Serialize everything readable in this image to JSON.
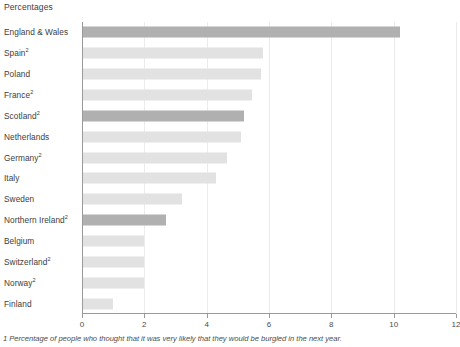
{
  "chart": {
    "title": "Percentages",
    "footnote": "1 Percentage of people who thought that it was very likely that they would be burgled in the next year.",
    "highlight_color": "#b0b0b0",
    "bar_color": "#e2e2e2",
    "axis_color": "#9a9a9a",
    "grid_color": "#ebebeb",
    "text_color": "#404040"
  },
  "chart_data": {
    "type": "bar",
    "orientation": "horizontal",
    "title": "Percentages",
    "xlabel": "",
    "ylabel": "",
    "xlim": [
      0,
      12
    ],
    "xticks": [
      0,
      2,
      4,
      6,
      8,
      10,
      12
    ],
    "xtick_labels": [
      "0",
      "2",
      "4",
      "6",
      "8",
      "10",
      "12"
    ],
    "grid": true,
    "legend": false,
    "categories": [
      "England & Wales",
      "Spain",
      "Poland",
      "France",
      "Scotland",
      "Netherlands",
      "Germany",
      "Italy",
      "Sweden",
      "Northern Ireland",
      "Belgium",
      "Switzerland",
      "Norway",
      "Finland"
    ],
    "category_footnote_markers": [
      "",
      "2",
      "",
      "2",
      "2",
      "",
      "2",
      "",
      "",
      "2",
      "",
      "2",
      "2",
      ""
    ],
    "values": [
      10.2,
      5.8,
      5.75,
      5.45,
      5.2,
      5.1,
      4.65,
      4.3,
      3.2,
      2.7,
      2.0,
      2.0,
      2.0,
      1.0
    ],
    "highlighted": [
      true,
      false,
      false,
      false,
      true,
      false,
      false,
      false,
      false,
      true,
      false,
      false,
      false,
      false
    ],
    "bars": [
      {
        "label": "England & Wales",
        "marker": "",
        "value": 10.2,
        "highlight": true
      },
      {
        "label": "Spain",
        "marker": "2",
        "value": 5.8,
        "highlight": false
      },
      {
        "label": "Poland",
        "marker": "",
        "value": 5.75,
        "highlight": false
      },
      {
        "label": "France",
        "marker": "2",
        "value": 5.45,
        "highlight": false
      },
      {
        "label": "Scotland",
        "marker": "2",
        "value": 5.2,
        "highlight": true
      },
      {
        "label": "Netherlands",
        "marker": "",
        "value": 5.1,
        "highlight": false
      },
      {
        "label": "Germany",
        "marker": "2",
        "value": 4.65,
        "highlight": false
      },
      {
        "label": "Italy",
        "marker": "",
        "value": 4.3,
        "highlight": false
      },
      {
        "label": "Sweden",
        "marker": "",
        "value": 3.2,
        "highlight": false
      },
      {
        "label": "Northern Ireland",
        "marker": "2",
        "value": 2.7,
        "highlight": true
      },
      {
        "label": "Belgium",
        "marker": "",
        "value": 2.0,
        "highlight": false
      },
      {
        "label": "Switzerland",
        "marker": "2",
        "value": 2.0,
        "highlight": false
      },
      {
        "label": "Norway",
        "marker": "2",
        "value": 2.0,
        "highlight": false
      },
      {
        "label": "Finland",
        "marker": "",
        "value": 1.0,
        "highlight": false
      }
    ]
  }
}
